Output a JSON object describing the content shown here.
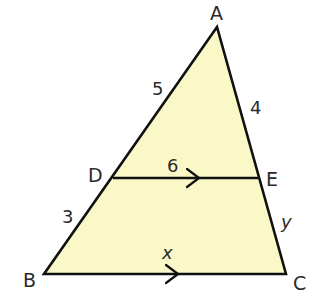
{
  "diagram": {
    "type": "triangle-with-parallel-segment",
    "colors": {
      "fill": "#fbf8c8",
      "stroke": "#111111",
      "text": "#2a2a2a",
      "background": "#ffffff"
    },
    "vertices": {
      "A": {
        "label": "A",
        "x": 217,
        "y": 27
      },
      "B": {
        "label": "B",
        "x": 44,
        "y": 274
      },
      "C": {
        "label": "C",
        "x": 286,
        "y": 274
      },
      "D": {
        "label": "D",
        "x": 113,
        "y": 178
      },
      "E": {
        "label": "E",
        "x": 260,
        "y": 178
      }
    },
    "segments": {
      "AD": {
        "label": "5"
      },
      "AE": {
        "label": "4"
      },
      "DE": {
        "label": "6",
        "parallel_marker": "arrow"
      },
      "DB": {
        "label": "3"
      },
      "EC": {
        "label": "y"
      },
      "BC": {
        "label": "x",
        "parallel_marker": "arrow"
      }
    },
    "relations": [
      "DE ∥ BC"
    ]
  }
}
